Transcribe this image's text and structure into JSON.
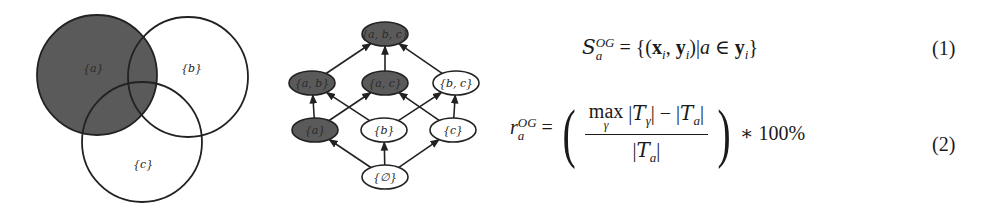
{
  "venn": {
    "sets": [
      {
        "label": "{a}",
        "cx": 97,
        "cy": 75,
        "r": 60,
        "highlighted": true
      },
      {
        "label": "{b}",
        "cx": 188,
        "cy": 77,
        "r": 60,
        "highlighted": false
      },
      {
        "label": "{c}",
        "cx": 142,
        "cy": 142,
        "r": 60,
        "highlighted": false
      }
    ],
    "highlight_color": "#5a5a5a"
  },
  "lattice": {
    "nodes": [
      {
        "id": "abc",
        "label": "{a, b, c}",
        "x": 385,
        "y": 34,
        "highlighted": true
      },
      {
        "id": "ab",
        "label": "{a, b}",
        "x": 312,
        "y": 83,
        "highlighted": true
      },
      {
        "id": "ac",
        "label": "{a, c}",
        "x": 385,
        "y": 83,
        "highlighted": true
      },
      {
        "id": "bc",
        "label": "{b, c}",
        "x": 456,
        "y": 83,
        "highlighted": false
      },
      {
        "id": "a",
        "label": "{a}",
        "x": 315,
        "y": 130,
        "highlighted": true
      },
      {
        "id": "b",
        "label": "{b}",
        "x": 384,
        "y": 130,
        "highlighted": false
      },
      {
        "id": "c",
        "label": "{c}",
        "x": 453,
        "y": 130,
        "highlighted": false
      },
      {
        "id": "empty",
        "label": "{∅}",
        "x": 385,
        "y": 177,
        "highlighted": false
      }
    ],
    "edges": [
      [
        "empty",
        "a"
      ],
      [
        "empty",
        "b"
      ],
      [
        "empty",
        "c"
      ],
      [
        "a",
        "ab"
      ],
      [
        "a",
        "ac"
      ],
      [
        "b",
        "ab"
      ],
      [
        "b",
        "bc"
      ],
      [
        "c",
        "ac"
      ],
      [
        "c",
        "bc"
      ],
      [
        "ab",
        "abc"
      ],
      [
        "ac",
        "abc"
      ],
      [
        "bc",
        "abc"
      ]
    ]
  },
  "equations": [
    {
      "number": "(1)",
      "lhs_symbol": "S",
      "lhs_sup": "OG",
      "lhs_sub": "a",
      "rhs": "= {(x_i, y_i) | a ∈ y_i}"
    },
    {
      "number": "(2)",
      "lhs_symbol": "r",
      "lhs_sup": "OG",
      "lhs_sub": "a",
      "numerator": "max_γ |T_γ| − |T_a|",
      "denominator": "|T_a|",
      "multiplier": "∗ 100%"
    }
  ],
  "text": {
    "eq1_eq": "=",
    "eq1_open": "{(",
    "eq1_x": "x",
    "eq1_i": "i",
    "eq1_comma": ", ",
    "eq1_y": "y",
    "eq1_i2": "i",
    "eq1_mid": ")|",
    "eq1_a": "a",
    "eq1_in": " ∈ ",
    "eq1_y2": "y",
    "eq1_i3": "i",
    "eq1_close": "}",
    "max": "max",
    "gamma": "γ",
    "bar": "|",
    "T": "T",
    "minus": " − ",
    "lparen": "(",
    "rparen": ")",
    "times": "∗ 100%"
  }
}
